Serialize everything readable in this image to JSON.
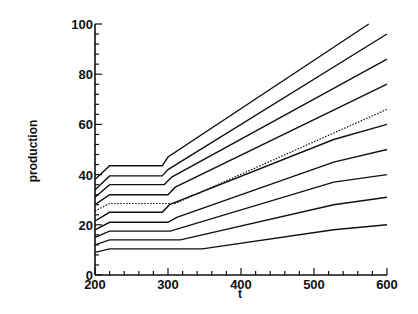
{
  "chart_data": {
    "type": "line",
    "title": "",
    "xlabel": "t",
    "ylabel": "production",
    "xlim": [
      200,
      600
    ],
    "ylim": [
      0,
      100
    ],
    "x_ticks": [
      200,
      300,
      400,
      500,
      600
    ],
    "y_ticks": [
      0,
      20,
      40,
      60,
      80,
      100
    ],
    "grid": false,
    "legend": null,
    "series": [
      {
        "name": "line-1",
        "style": "solid",
        "points": [
          [
            200,
            38
          ],
          [
            220,
            43.5
          ],
          [
            292,
            43.5
          ],
          [
            300,
            47
          ],
          [
            575,
            100
          ]
        ]
      },
      {
        "name": "line-2",
        "style": "solid",
        "points": [
          [
            200,
            34
          ],
          [
            220,
            39.5
          ],
          [
            292,
            39.5
          ],
          [
            300,
            42
          ],
          [
            600,
            96
          ]
        ]
      },
      {
        "name": "line-3",
        "style": "solid",
        "points": [
          [
            200,
            31
          ],
          [
            220,
            36
          ],
          [
            295,
            36
          ],
          [
            305,
            39
          ],
          [
            600,
            86
          ]
        ]
      },
      {
        "name": "line-4",
        "style": "solid",
        "points": [
          [
            200,
            28
          ],
          [
            220,
            32
          ],
          [
            300,
            32
          ],
          [
            310,
            35
          ],
          [
            600,
            76
          ]
        ]
      },
      {
        "name": "line-5",
        "style": "dotted",
        "points": [
          [
            200,
            25.5
          ],
          [
            220,
            28.5
          ],
          [
            310,
            28.5
          ],
          [
            600,
            66
          ]
        ]
      },
      {
        "name": "line-6",
        "style": "solid",
        "points": [
          [
            200,
            21.5
          ],
          [
            220,
            25
          ],
          [
            292,
            25
          ],
          [
            302,
            28
          ],
          [
            527,
            54
          ],
          [
            600,
            60
          ]
        ]
      },
      {
        "name": "line-7",
        "style": "solid",
        "points": [
          [
            200,
            18
          ],
          [
            220,
            21
          ],
          [
            300,
            21
          ],
          [
            312,
            23
          ],
          [
            527,
            45
          ],
          [
            600,
            50
          ]
        ]
      },
      {
        "name": "line-8",
        "style": "solid",
        "points": [
          [
            200,
            15
          ],
          [
            220,
            17.5
          ],
          [
            303,
            17.5
          ],
          [
            527,
            37
          ],
          [
            600,
            40
          ]
        ]
      },
      {
        "name": "line-9",
        "style": "solid",
        "points": [
          [
            200,
            12
          ],
          [
            220,
            14
          ],
          [
            317,
            14
          ],
          [
            527,
            28
          ],
          [
            600,
            31
          ]
        ]
      },
      {
        "name": "line-10",
        "style": "solid",
        "points": [
          [
            200,
            9
          ],
          [
            220,
            10.4
          ],
          [
            347,
            10.4
          ],
          [
            527,
            18
          ],
          [
            600,
            20
          ]
        ]
      }
    ]
  }
}
